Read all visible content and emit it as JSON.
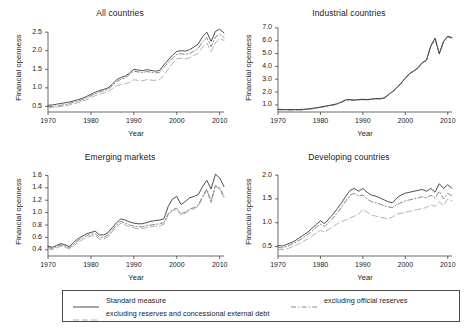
{
  "figure": {
    "xlabel": "Year",
    "ylabel": "Financial openness",
    "xticks": [
      "1970",
      "1980",
      "1990",
      "2000",
      "2010"
    ]
  },
  "legend": {
    "entries": [
      {
        "label": "Standard measure",
        "style": "solid",
        "color": "#3a3a3a"
      },
      {
        "label": "excluding official reserves",
        "style": "dashdot",
        "color": "#7a7a7a"
      },
      {
        "label": "excluding reserves and concessional external debt",
        "style": "longdash",
        "color": "#b4b4b4"
      }
    ]
  },
  "chart_data": [
    {
      "type": "line",
      "title": "All countries",
      "xlabel": "Year",
      "ylabel": "Financial openness",
      "xlim": [
        1970,
        2011
      ],
      "ylim": [
        0.35,
        2.72
      ],
      "yticks": [
        0.5,
        1.0,
        1.5,
        2.0,
        2.5
      ],
      "ytick_labels": [
        "0.5",
        "1.0",
        "1.5",
        "2.0",
        "2.5"
      ],
      "xticks": [
        1970,
        1980,
        1990,
        2000,
        2010
      ],
      "grid": false,
      "x": [
        1970,
        1971,
        1972,
        1973,
        1974,
        1975,
        1976,
        1977,
        1978,
        1979,
        1980,
        1981,
        1982,
        1983,
        1984,
        1985,
        1986,
        1987,
        1988,
        1989,
        1990,
        1991,
        1992,
        1993,
        1994,
        1995,
        1996,
        1997,
        1998,
        1999,
        2000,
        2001,
        2002,
        2003,
        2004,
        2005,
        2006,
        2007,
        2008,
        2009,
        2010,
        2011
      ],
      "series": [
        {
          "name": "Standard measure",
          "style": "solid",
          "color": "#3a3a3a",
          "values": [
            0.53,
            0.54,
            0.56,
            0.58,
            0.6,
            0.62,
            0.65,
            0.68,
            0.72,
            0.77,
            0.83,
            0.88,
            0.93,
            0.96,
            1.0,
            1.1,
            1.22,
            1.28,
            1.32,
            1.4,
            1.5,
            1.48,
            1.46,
            1.49,
            1.47,
            1.45,
            1.47,
            1.62,
            1.75,
            1.88,
            1.98,
            2.0,
            1.99,
            2.03,
            2.1,
            2.18,
            2.38,
            2.5,
            2.25,
            2.52,
            2.58,
            2.48
          ]
        },
        {
          "name": "excluding official reserves",
          "style": "dashdot",
          "color": "#7a7a7a",
          "values": [
            0.5,
            0.5,
            0.51,
            0.53,
            0.55,
            0.58,
            0.61,
            0.64,
            0.68,
            0.73,
            0.79,
            0.84,
            0.89,
            0.92,
            0.96,
            1.06,
            1.17,
            1.23,
            1.27,
            1.36,
            1.45,
            1.43,
            1.41,
            1.44,
            1.42,
            1.4,
            1.42,
            1.55,
            1.68,
            1.8,
            1.9,
            1.92,
            1.9,
            1.93,
            1.99,
            2.06,
            2.24,
            2.35,
            2.11,
            2.37,
            2.44,
            2.36
          ]
        },
        {
          "name": "excluding reserves and concessional external debt",
          "style": "longdash",
          "color": "#b4b4b4",
          "values": [
            0.47,
            0.47,
            0.48,
            0.5,
            0.52,
            0.54,
            0.57,
            0.6,
            0.64,
            0.68,
            0.74,
            0.79,
            0.83,
            0.86,
            0.9,
            0.98,
            1.06,
            1.09,
            1.11,
            1.15,
            1.22,
            1.2,
            1.19,
            1.22,
            1.21,
            1.2,
            1.22,
            1.35,
            1.5,
            1.66,
            1.78,
            1.8,
            1.78,
            1.81,
            1.87,
            1.93,
            2.1,
            2.2,
            1.98,
            2.22,
            2.32,
            2.28
          ]
        }
      ]
    },
    {
      "type": "line",
      "title": "Industrial countries",
      "xlabel": "Year",
      "ylabel": "Financial openness",
      "xlim": [
        1970,
        2011
      ],
      "ylim": [
        0.45,
        7.3
      ],
      "yticks": [
        1.0,
        2.0,
        3.0,
        4.0,
        5.0,
        6.0,
        7.0
      ],
      "ytick_labels": [
        "1.0",
        "2.0",
        "3.0",
        "4.0",
        "5.0",
        "6.0",
        "7.0"
      ],
      "xticks": [
        1970,
        1980,
        1990,
        2000,
        2010
      ],
      "grid": false,
      "x": [
        1970,
        1971,
        1972,
        1973,
        1974,
        1975,
        1976,
        1977,
        1978,
        1979,
        1980,
        1981,
        1982,
        1983,
        1984,
        1985,
        1986,
        1987,
        1988,
        1989,
        1990,
        1991,
        1992,
        1993,
        1994,
        1995,
        1996,
        1997,
        1998,
        1999,
        2000,
        2001,
        2002,
        2003,
        2004,
        2005,
        2006,
        2007,
        2008,
        2009,
        2010,
        2011
      ],
      "series": [
        {
          "name": "Standard measure",
          "style": "solid",
          "color": "#3a3a3a",
          "values": [
            0.66,
            0.65,
            0.64,
            0.64,
            0.64,
            0.64,
            0.66,
            0.69,
            0.73,
            0.78,
            0.84,
            0.9,
            0.96,
            1.02,
            1.1,
            1.24,
            1.4,
            1.42,
            1.38,
            1.42,
            1.44,
            1.42,
            1.46,
            1.5,
            1.49,
            1.55,
            1.8,
            2.05,
            2.35,
            2.7,
            3.1,
            3.45,
            3.65,
            3.9,
            4.3,
            4.5,
            5.6,
            6.2,
            5.0,
            5.95,
            6.35,
            6.25
          ]
        },
        {
          "name": "excluding official reserves",
          "style": "dashdot",
          "color": "#7a7a7a",
          "values": [
            0.63,
            0.62,
            0.61,
            0.61,
            0.61,
            0.61,
            0.63,
            0.66,
            0.7,
            0.75,
            0.81,
            0.87,
            0.93,
            0.99,
            1.07,
            1.21,
            1.37,
            1.39,
            1.35,
            1.39,
            1.41,
            1.39,
            1.43,
            1.47,
            1.46,
            1.52,
            1.77,
            2.02,
            2.32,
            2.67,
            3.07,
            3.42,
            3.62,
            3.87,
            4.27,
            4.47,
            5.56,
            6.16,
            4.96,
            5.9,
            6.3,
            6.2
          ]
        },
        {
          "name": "excluding reserves and concessional external debt",
          "style": "longdash",
          "color": "#b4b4b4",
          "values": [
            0.63,
            0.62,
            0.61,
            0.61,
            0.61,
            0.61,
            0.63,
            0.66,
            0.7,
            0.75,
            0.81,
            0.87,
            0.93,
            0.99,
            1.07,
            1.21,
            1.37,
            1.39,
            1.35,
            1.39,
            1.41,
            1.39,
            1.43,
            1.47,
            1.46,
            1.52,
            1.77,
            2.02,
            2.32,
            2.67,
            3.07,
            3.42,
            3.62,
            3.87,
            4.27,
            4.47,
            5.56,
            6.16,
            4.96,
            5.9,
            6.3,
            6.2
          ]
        }
      ]
    },
    {
      "type": "line",
      "title": "Emerging markets",
      "xlabel": "Year",
      "ylabel": "Financial openness",
      "xlim": [
        1970,
        2011
      ],
      "ylim": [
        0.3,
        1.72
      ],
      "yticks": [
        0.4,
        0.6,
        0.8,
        1.0,
        1.2,
        1.4,
        1.6
      ],
      "ytick_labels": [
        "0.4",
        "0.6",
        "0.8",
        "1.0",
        "1.2",
        "1.4",
        "1.6"
      ],
      "xticks": [
        1970,
        1980,
        1990,
        2000,
        2010
      ],
      "grid": false,
      "x": [
        1970,
        1971,
        1972,
        1973,
        1974,
        1975,
        1976,
        1977,
        1978,
        1979,
        1980,
        1981,
        1982,
        1983,
        1984,
        1985,
        1986,
        1987,
        1988,
        1989,
        1990,
        1991,
        1992,
        1993,
        1994,
        1995,
        1996,
        1997,
        1998,
        1999,
        2000,
        2001,
        2002,
        2003,
        2004,
        2005,
        2006,
        2007,
        2008,
        2009,
        2010,
        2011
      ],
      "series": [
        {
          "name": "Standard measure",
          "style": "solid",
          "color": "#3a3a3a",
          "values": [
            0.46,
            0.44,
            0.47,
            0.5,
            0.48,
            0.45,
            0.52,
            0.58,
            0.62,
            0.66,
            0.68,
            0.7,
            0.64,
            0.64,
            0.68,
            0.76,
            0.84,
            0.9,
            0.88,
            0.85,
            0.83,
            0.82,
            0.82,
            0.84,
            0.86,
            0.87,
            0.88,
            0.9,
            1.1,
            1.22,
            1.26,
            1.13,
            1.18,
            1.24,
            1.26,
            1.29,
            1.42,
            1.52,
            1.38,
            1.62,
            1.56,
            1.42
          ]
        },
        {
          "name": "excluding official reserves",
          "style": "dashdot",
          "color": "#7a7a7a",
          "values": [
            0.44,
            0.42,
            0.45,
            0.48,
            0.46,
            0.43,
            0.49,
            0.55,
            0.59,
            0.63,
            0.65,
            0.66,
            0.6,
            0.6,
            0.64,
            0.72,
            0.8,
            0.86,
            0.83,
            0.8,
            0.78,
            0.77,
            0.77,
            0.79,
            0.8,
            0.81,
            0.82,
            0.84,
            0.98,
            1.05,
            1.07,
            0.98,
            1.01,
            1.06,
            1.08,
            1.12,
            1.26,
            1.38,
            1.18,
            1.44,
            1.4,
            1.26
          ]
        },
        {
          "name": "excluding reserves and concessional external debt",
          "style": "longdash",
          "color": "#b4b4b4",
          "values": [
            0.42,
            0.4,
            0.43,
            0.46,
            0.44,
            0.41,
            0.47,
            0.52,
            0.56,
            0.6,
            0.62,
            0.63,
            0.57,
            0.57,
            0.61,
            0.69,
            0.77,
            0.83,
            0.8,
            0.77,
            0.75,
            0.74,
            0.74,
            0.76,
            0.77,
            0.78,
            0.79,
            0.81,
            0.96,
            1.03,
            1.05,
            0.96,
            0.99,
            1.04,
            1.06,
            1.1,
            1.24,
            1.36,
            1.16,
            1.42,
            1.38,
            1.24
          ]
        }
      ]
    },
    {
      "type": "line",
      "title": "Developing countries",
      "xlabel": "Year",
      "ylabel": "Financial openness",
      "xlim": [
        1970,
        2011
      ],
      "ylim": [
        0.3,
        2.15
      ],
      "yticks": [
        0.5,
        1.0,
        1.5,
        2.0
      ],
      "ytick_labels": [
        "0.5",
        "1.0",
        "1.5",
        "2.0"
      ],
      "xticks": [
        1970,
        1980,
        1990,
        2000,
        2010
      ],
      "grid": false,
      "x": [
        1970,
        1971,
        1972,
        1973,
        1974,
        1975,
        1976,
        1977,
        1978,
        1979,
        1980,
        1981,
        1982,
        1983,
        1984,
        1985,
        1986,
        1987,
        1988,
        1989,
        1990,
        1991,
        1992,
        1993,
        1994,
        1995,
        1996,
        1997,
        1998,
        1999,
        2000,
        2001,
        2002,
        2003,
        2004,
        2005,
        2006,
        2007,
        2008,
        2009,
        2010,
        2011
      ],
      "series": [
        {
          "name": "Standard measure",
          "style": "solid",
          "color": "#3a3a3a",
          "values": [
            0.52,
            0.51,
            0.54,
            0.58,
            0.62,
            0.68,
            0.74,
            0.8,
            0.88,
            0.96,
            1.04,
            0.98,
            1.08,
            1.18,
            1.3,
            1.42,
            1.56,
            1.68,
            1.72,
            1.66,
            1.72,
            1.64,
            1.58,
            1.56,
            1.52,
            1.48,
            1.44,
            1.42,
            1.52,
            1.58,
            1.62,
            1.64,
            1.66,
            1.68,
            1.7,
            1.66,
            1.72,
            1.64,
            1.82,
            1.72,
            1.8,
            1.72
          ]
        },
        {
          "name": "excluding official reserves",
          "style": "dashdot",
          "color": "#7a7a7a",
          "values": [
            0.48,
            0.47,
            0.5,
            0.54,
            0.58,
            0.63,
            0.69,
            0.75,
            0.82,
            0.9,
            0.97,
            0.92,
            1.01,
            1.1,
            1.21,
            1.33,
            1.46,
            1.58,
            1.62,
            1.56,
            1.58,
            1.5,
            1.44,
            1.42,
            1.39,
            1.36,
            1.33,
            1.32,
            1.38,
            1.42,
            1.46,
            1.48,
            1.5,
            1.52,
            1.55,
            1.52,
            1.58,
            1.52,
            1.66,
            1.5,
            1.62,
            1.56
          ]
        },
        {
          "name": "excluding reserves and concessional external debt",
          "style": "longdash",
          "color": "#b4b4b4",
          "values": [
            0.44,
            0.43,
            0.45,
            0.48,
            0.52,
            0.56,
            0.61,
            0.66,
            0.72,
            0.78,
            0.84,
            0.8,
            0.86,
            0.92,
            0.98,
            1.02,
            1.06,
            1.1,
            1.14,
            1.18,
            1.28,
            1.22,
            1.16,
            1.14,
            1.12,
            1.1,
            1.08,
            1.12,
            1.18,
            1.2,
            1.22,
            1.24,
            1.26,
            1.28,
            1.3,
            1.32,
            1.38,
            1.34,
            1.44,
            1.36,
            1.5,
            1.46
          ]
        }
      ]
    }
  ]
}
